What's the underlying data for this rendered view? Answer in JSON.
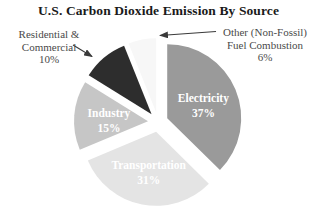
{
  "chart_data": {
    "type": "pie",
    "title": "U.S. Carbon Dioxide Emission By Source",
    "units": "percent",
    "slices": [
      {
        "label": "Electricity",
        "value": 37,
        "color": "#9a9a9a",
        "text_color": "#ffffff",
        "inside_label": true
      },
      {
        "label": "Transportation",
        "value": 31,
        "color": "#e4e4e4",
        "text_color": "#ffffff",
        "inside_label": true
      },
      {
        "label": "Industry",
        "value": 15,
        "color": "#c6c6c6",
        "text_color": "#ffffff",
        "inside_label": true
      },
      {
        "label": "Residential & Commercial",
        "value": 10,
        "color": "#2d2d2d",
        "text_color": "#ffffff",
        "inside_label": false
      },
      {
        "label": "Other (Non-Fossil) Fuel Combustion",
        "value": 6,
        "color": "#f7f7f7",
        "text_color": "#4a4a4a",
        "inside_label": false
      }
    ],
    "layout": {
      "start_angle_deg": 0,
      "direction": "clockwise",
      "exploded": true,
      "legend": "none",
      "callout_labels": [
        "Residential & Commercial",
        "Other (Non-Fossil) Fuel Combustion"
      ]
    }
  },
  "callouts": {
    "residential": {
      "line1": "Residential &",
      "line2": "Commercial",
      "pct": "10%"
    },
    "other": {
      "line1": "Other (Non-Fossil)",
      "line2": "Fuel Combustion",
      "pct": "6%"
    }
  },
  "colors": {
    "background": "#ffffff",
    "title_text": "#1a1a1a",
    "callout_text": "#4a4a4a",
    "arrow": "#3a3a3a"
  }
}
